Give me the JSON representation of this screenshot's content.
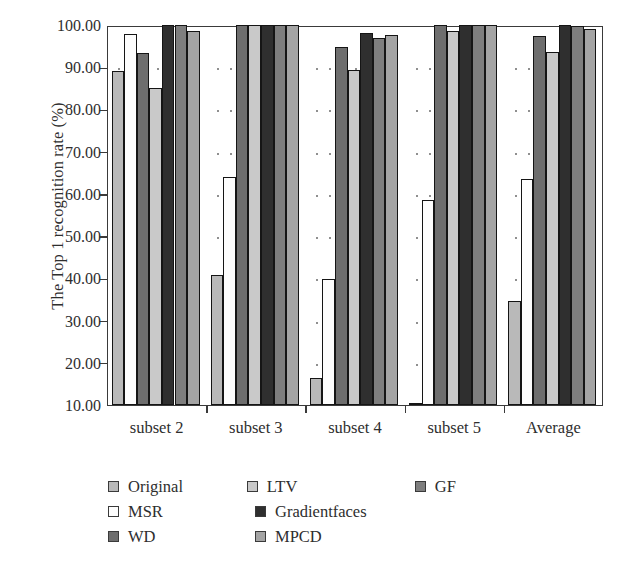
{
  "chart_data": {
    "type": "bar",
    "title": "",
    "xlabel": "",
    "ylabel": "The Top 1 recognition rate (%)",
    "categories": [
      "subset 2",
      "subset 3",
      "subset 4",
      "subset 5",
      "Average"
    ],
    "ylim": [
      10,
      100
    ],
    "yticks": [
      "10.00",
      "20.00",
      "30.00",
      "40.00",
      "50.00",
      "60.00",
      "70.00",
      "80.00",
      "90.00",
      "100.00"
    ],
    "ytick_values": [
      10,
      20,
      30,
      40,
      50,
      60,
      70,
      80,
      90,
      100
    ],
    "grid": "dotted",
    "legend_position": "below-plot",
    "series": [
      {
        "name": "Original",
        "color": "#b9b9b9",
        "values": [
          89.2,
          40.8,
          16.5,
          10.4,
          34.7
        ]
      },
      {
        "name": "MSR",
        "color": "#fdfdfd",
        "values": [
          97.8,
          64.0,
          39.8,
          58.6,
          63.5
        ]
      },
      {
        "name": "WD",
        "color": "#6e6e6e",
        "values": [
          93.3,
          100.0,
          94.8,
          100.0,
          97.3
        ]
      },
      {
        "name": "LTV",
        "color": "#c9c9c9",
        "values": [
          85.0,
          100.0,
          89.3,
          98.6,
          93.6
        ]
      },
      {
        "name": "Gradientfaces",
        "color": "#2f2f2f",
        "values": [
          100.0,
          100.0,
          98.0,
          100.0,
          100.0
        ]
      },
      {
        "name": "GF",
        "color": "#7e7e7e",
        "values": [
          100.0,
          100.0,
          97.0,
          100.0,
          99.7
        ]
      },
      {
        "name": "MPCD",
        "color": "#a4a4a4",
        "values": [
          98.7,
          100.0,
          97.6,
          100.0,
          99.0
        ]
      }
    ]
  },
  "legend": {
    "rows": [
      [
        {
          "label": "Original",
          "color": "#b9b9b9"
        },
        {
          "label": "LTV",
          "color": "#c9c9c9"
        },
        {
          "label": "GF",
          "color": "#7e7e7e"
        }
      ],
      [
        {
          "label": "MSR",
          "color": "#fdfdfd"
        },
        {
          "label": "Gradientfaces",
          "color": "#2f2f2f"
        }
      ],
      [
        {
          "label": "WD",
          "color": "#6e6e6e"
        },
        {
          "label": "MPCD",
          "color": "#a4a4a4"
        }
      ]
    ]
  }
}
